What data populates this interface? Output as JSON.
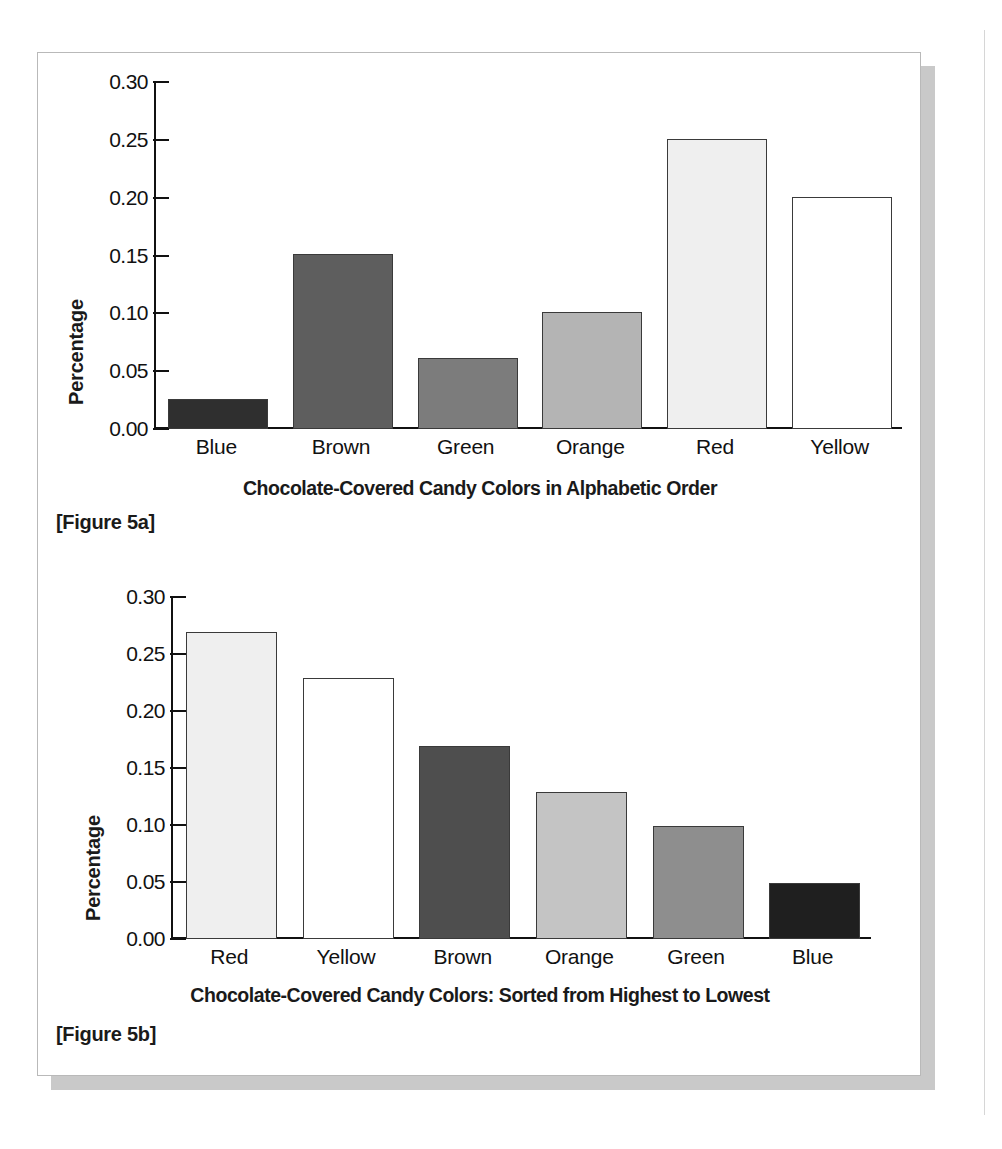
{
  "document": {
    "figures": [
      {
        "tag": "[Figure 5a]",
        "caption": "Chocolate-Covered Candy Colors in Alphabetic Order"
      },
      {
        "tag": "[Figure 5b]",
        "caption": "Chocolate-Covered Candy Colors: Sorted from Highest to Lowest"
      }
    ]
  },
  "chart_data": [
    {
      "type": "bar",
      "title": "Chocolate-Covered Candy Colors in Alphabetic Order",
      "figure_label": "[Figure 5a]",
      "xlabel": "Chocolate-Covered Candy Colors in Alphabetic Order",
      "ylabel": "Percentage",
      "categories": [
        "Blue",
        "Brown",
        "Green",
        "Orange",
        "Red",
        "Yellow"
      ],
      "values": [
        0.026,
        0.151,
        0.061,
        0.101,
        0.251,
        0.201
      ],
      "bar_colors": [
        "#2f2f2f",
        "#5e5e5e",
        "#7c7c7c",
        "#b4b4b4",
        "#efefef",
        "#ffffff"
      ],
      "ylim": [
        0.0,
        0.3
      ],
      "ytick_labels": [
        "0.30",
        "0.25",
        "0.20",
        "0.15",
        "0.10",
        "0.05",
        "0.00"
      ],
      "ytick_values": [
        0.3,
        0.25,
        0.2,
        0.15,
        0.1,
        0.05,
        0.0
      ],
      "grid": false,
      "legend": false
    },
    {
      "type": "bar",
      "title": "Chocolate-Covered Candy Colors: Sorted from Highest to Lowest",
      "figure_label": "[Figure 5b]",
      "xlabel": "Chocolate-Covered Candy Colors: Sorted from Highest to Lowest",
      "ylabel": "Percentage",
      "categories": [
        "Red",
        "Yellow",
        "Brown",
        "Orange",
        "Green",
        "Blue"
      ],
      "values": [
        0.269,
        0.229,
        0.169,
        0.129,
        0.099,
        0.049
      ],
      "bar_colors": [
        "#efefef",
        "#ffffff",
        "#4e4e4e",
        "#c4c4c4",
        "#8e8e8e",
        "#1f1f1f"
      ],
      "ylim": [
        0.0,
        0.3
      ],
      "ytick_labels": [
        "0.30",
        "0.25",
        "0.20",
        "0.15",
        "0.10",
        "0.05",
        "0.00"
      ],
      "ytick_values": [
        0.3,
        0.25,
        0.2,
        0.15,
        0.1,
        0.05,
        0.0
      ],
      "grid": false,
      "legend": false
    }
  ],
  "style": {
    "axis_color": "#111111",
    "bar_outline": "#3a3a3a",
    "page_border": "#b9b9b9",
    "page_shadow": "#c9c9c9",
    "text_color": "#1a1a1a"
  }
}
